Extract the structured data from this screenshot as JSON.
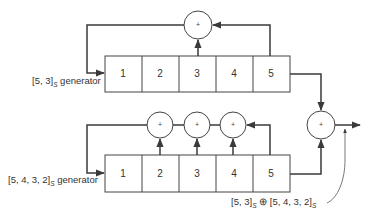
{
  "diagram": {
    "top_register": {
      "label_main": "[5, 3]",
      "label_sub": "S",
      "label_suffix": " generator",
      "cells": [
        "1",
        "2",
        "3",
        "4",
        "5"
      ],
      "taps": [
        "3",
        "5"
      ],
      "adder_symbol": "+"
    },
    "bottom_register": {
      "label_main": "[5, 4, 3, 2]",
      "label_sub": "S",
      "label_suffix": " generator",
      "cells": [
        "1",
        "2",
        "3",
        "4",
        "5"
      ],
      "taps": [
        "2",
        "3",
        "4",
        "5"
      ],
      "adder_symbols": [
        "+",
        "+",
        "+"
      ]
    },
    "output_adder": {
      "symbol": "+"
    },
    "output_label": {
      "part1": "[5, 3]",
      "sub1": "S",
      "op": " ⊕ ",
      "part2": "[5, 4, 3, 2]",
      "sub2": "S"
    },
    "colors": {
      "line": "#3a3a3a",
      "background": "#ffffff"
    }
  }
}
